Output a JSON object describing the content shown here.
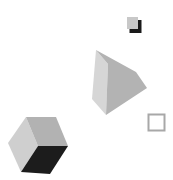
{
  "scene": {
    "background": "#ffffff",
    "shapes": [
      {
        "name": "small-square-with-shadow",
        "fill": "#c8c8c8",
        "shadow": "#1a1a1a"
      },
      {
        "name": "triangular-prism",
        "left_face": "#d4d4d4",
        "right_face": "#b4b4b4"
      },
      {
        "name": "outlined-square",
        "stroke": "#a8a8a8"
      },
      {
        "name": "cube",
        "left_face": "#cccccc",
        "top_face": "#b0b0b0",
        "dark_face": "#1c1c1c"
      }
    ]
  }
}
